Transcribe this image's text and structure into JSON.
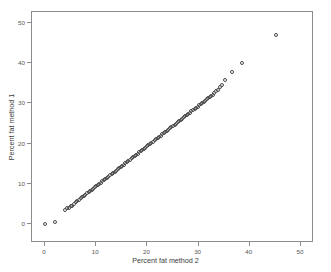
{
  "figure": {
    "width": 331,
    "height": 272,
    "background": "#ffffff",
    "frame_color": "#8c8c8c",
    "top_artifact_text": "·  ·     ·       ·    ·   ·"
  },
  "chart_data": {
    "type": "scatter",
    "title": "",
    "xlabel": "Percent fat method 2",
    "ylabel": "Percent fat method 1",
    "xlim": [
      -2.6,
      53.5
    ],
    "ylim": [
      -2.8,
      54.5
    ],
    "xticks": [
      0,
      10,
      20,
      30,
      40,
      50
    ],
    "yticks": [
      0,
      10,
      20,
      30,
      40,
      50
    ],
    "xtick_labels": [
      "0",
      "10",
      "20",
      "30",
      "40",
      "50"
    ],
    "ytick_labels": [
      "0",
      "10",
      "20",
      "30",
      "40",
      "50"
    ],
    "grid": false,
    "legend": false,
    "marker": {
      "shape": "open-circle",
      "size": 4,
      "edge_color": "#4a4a4a",
      "fill_color": "none"
    },
    "series": [
      {
        "name": "observations",
        "points": [
          [
            0.0,
            0.1
          ],
          [
            2.0,
            0.5
          ],
          [
            4.0,
            3.6
          ],
          [
            4.3,
            3.9
          ],
          [
            4.6,
            4.1
          ],
          [
            5.0,
            4.5
          ],
          [
            5.2,
            4.6
          ],
          [
            5.6,
            5.0
          ],
          [
            6.0,
            5.4
          ],
          [
            6.3,
            5.7
          ],
          [
            6.6,
            6.0
          ],
          [
            7.0,
            6.4
          ],
          [
            7.3,
            6.7
          ],
          [
            7.6,
            7.0
          ],
          [
            7.9,
            7.3
          ],
          [
            8.2,
            7.6
          ],
          [
            8.5,
            7.9
          ],
          [
            8.8,
            8.2
          ],
          [
            9.1,
            8.5
          ],
          [
            9.4,
            8.8
          ],
          [
            9.7,
            9.1
          ],
          [
            10.0,
            9.4
          ],
          [
            10.3,
            9.7
          ],
          [
            10.6,
            10.0
          ],
          [
            10.9,
            10.3
          ],
          [
            11.2,
            10.6
          ],
          [
            11.5,
            10.9
          ],
          [
            11.8,
            11.2
          ],
          [
            12.1,
            11.5
          ],
          [
            12.4,
            11.8
          ],
          [
            12.7,
            12.1
          ],
          [
            13.0,
            12.4
          ],
          [
            13.3,
            12.7
          ],
          [
            13.6,
            13.0
          ],
          [
            13.9,
            13.3
          ],
          [
            14.2,
            13.6
          ],
          [
            14.5,
            13.9
          ],
          [
            14.8,
            14.2
          ],
          [
            15.1,
            14.5
          ],
          [
            15.4,
            14.8
          ],
          [
            15.7,
            15.1
          ],
          [
            16.0,
            15.4
          ],
          [
            16.3,
            15.7
          ],
          [
            16.6,
            16.0
          ],
          [
            16.9,
            16.3
          ],
          [
            17.2,
            16.6
          ],
          [
            17.5,
            16.9
          ],
          [
            17.8,
            17.2
          ],
          [
            18.1,
            17.5
          ],
          [
            18.4,
            17.8
          ],
          [
            18.7,
            18.1
          ],
          [
            19.0,
            18.4
          ],
          [
            19.3,
            18.7
          ],
          [
            19.6,
            19.0
          ],
          [
            19.9,
            19.3
          ],
          [
            20.2,
            19.6
          ],
          [
            20.5,
            19.9
          ],
          [
            20.8,
            20.2
          ],
          [
            21.1,
            20.5
          ],
          [
            21.4,
            20.8
          ],
          [
            21.7,
            21.1
          ],
          [
            22.0,
            21.4
          ],
          [
            22.3,
            21.7
          ],
          [
            22.6,
            22.0
          ],
          [
            22.9,
            22.3
          ],
          [
            23.2,
            22.6
          ],
          [
            23.5,
            22.9
          ],
          [
            23.8,
            23.2
          ],
          [
            24.1,
            23.5
          ],
          [
            24.4,
            23.8
          ],
          [
            24.7,
            24.1
          ],
          [
            25.0,
            24.4
          ],
          [
            25.3,
            24.7
          ],
          [
            25.6,
            25.0
          ],
          [
            25.9,
            25.3
          ],
          [
            26.2,
            25.6
          ],
          [
            26.5,
            25.9
          ],
          [
            26.8,
            26.2
          ],
          [
            27.1,
            26.5
          ],
          [
            27.4,
            26.8
          ],
          [
            27.7,
            27.1
          ],
          [
            28.0,
            27.4
          ],
          [
            28.3,
            27.7
          ],
          [
            28.6,
            28.0
          ],
          [
            28.9,
            28.3
          ],
          [
            29.2,
            28.6
          ],
          [
            29.5,
            28.9
          ],
          [
            29.8,
            29.2
          ],
          [
            30.1,
            29.5
          ],
          [
            30.4,
            29.8
          ],
          [
            30.7,
            30.1
          ],
          [
            31.0,
            30.4
          ],
          [
            31.3,
            30.7
          ],
          [
            31.6,
            31.0
          ],
          [
            31.9,
            31.3
          ],
          [
            32.2,
            31.6
          ],
          [
            32.5,
            31.9
          ],
          [
            32.8,
            32.2
          ],
          [
            33.1,
            32.6
          ],
          [
            33.4,
            33.0
          ],
          [
            33.8,
            33.4
          ],
          [
            34.2,
            34.2
          ],
          [
            34.6,
            34.6
          ],
          [
            35.2,
            35.8
          ],
          [
            36.6,
            37.8
          ],
          [
            38.4,
            40.0
          ],
          [
            45.2,
            47.0
          ]
        ]
      }
    ]
  },
  "axes_geometry": {
    "frame_left": 31,
    "frame_top": 11,
    "frame_width": 282,
    "frame_height": 231,
    "x_origin_px": 44,
    "x_unit_px": 5.12,
    "y_origin_px": 223,
    "y_unit_px": 4.02
  }
}
